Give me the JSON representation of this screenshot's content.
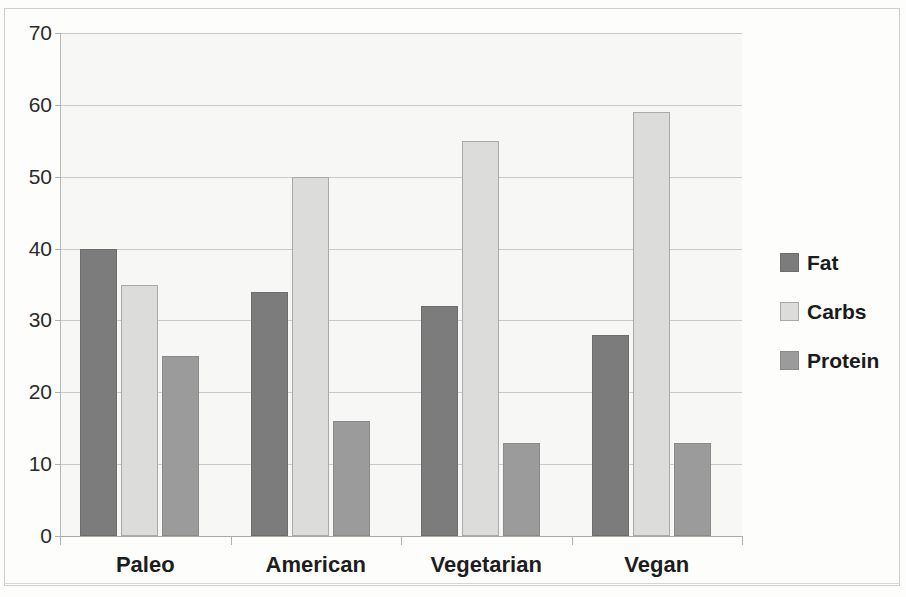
{
  "chart_data": {
    "type": "bar",
    "title": "",
    "xlabel": "",
    "ylabel": "",
    "categories": [
      "Paleo",
      "American",
      "Vegetarian",
      "Vegan"
    ],
    "series": [
      {
        "name": "Fat",
        "color": "#7c7c7c",
        "values": [
          40,
          34,
          32,
          28
        ]
      },
      {
        "name": "Carbs",
        "color": "#dcdcda",
        "values": [
          35,
          50,
          55,
          59
        ]
      },
      {
        "name": "Protein",
        "color": "#9b9b9b",
        "values": [
          25,
          16,
          13,
          13
        ]
      }
    ],
    "ylim": [
      0,
      70
    ],
    "yticks": [
      0,
      10,
      20,
      30,
      40,
      50,
      60,
      70
    ],
    "ytick_labels": [
      "0",
      "10",
      "20",
      "30",
      "40",
      "50",
      "60",
      "70"
    ],
    "grid": true,
    "grid_axis": "y",
    "legend_position": "right",
    "legend_entries": [
      "Fat",
      "Carbs",
      "Protein"
    ]
  },
  "colors": {
    "fat": "#7c7c7c",
    "carbs": "#dcdcda",
    "protein": "#9b9b9b",
    "plot_background": "#f7f7f5",
    "gridline": "#c9c9c9",
    "axis": "#aaaaaa",
    "text": "#1d1d1d"
  }
}
